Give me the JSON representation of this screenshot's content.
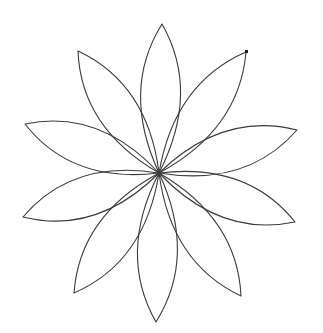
{
  "figure": {
    "type": "turtle-graphics flower",
    "petal_count": 10,
    "center": [
      159,
      173
    ],
    "stroke_color": "#3a3a3a",
    "background": "#ffffff",
    "bulge": 40,
    "petal_tips": [
      [
        162,
        24
      ],
      [
        246,
        52
      ],
      [
        297,
        130
      ],
      [
        295,
        222
      ],
      [
        241,
        296
      ],
      [
        156,
        322
      ],
      [
        74,
        293
      ],
      [
        23,
        217
      ],
      [
        25,
        124
      ],
      [
        78,
        51
      ]
    ],
    "cursor": {
      "position": [
        246,
        52
      ],
      "icon": "turtle-cursor-icon"
    }
  }
}
